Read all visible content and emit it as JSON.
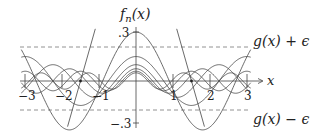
{
  "chart_data": {
    "type": "line",
    "title": "",
    "xlabel": "x",
    "ylabel": "f_n(x)",
    "xlim": [
      -3.1,
      3.3
    ],
    "ylim": [
      -0.35,
      0.35
    ],
    "x_ticks": [
      -3,
      -2,
      -1,
      1,
      2,
      3
    ],
    "x_tick_labels": [
      "−3",
      "−2",
      "−1",
      "1",
      "2",
      "3"
    ],
    "y_ticks": [
      0.3,
      -0.3
    ],
    "y_tick_labels": [
      ".3",
      "−.3"
    ],
    "grid": false,
    "epsilon": 0.2,
    "bands": [
      {
        "name": "g(x) + ε",
        "y": 0.2,
        "style": "dashed"
      },
      {
        "name": "g(x) − ε",
        "y": -0.2,
        "style": "dashed"
      }
    ],
    "annotations": [
      {
        "text": "g(x) + ε",
        "x": 3.1,
        "y": 0.22
      },
      {
        "text": "g(x) − ε",
        "x": 3.1,
        "y": -0.3
      }
    ],
    "points": [
      {
        "x": -1.5,
        "y": 0
      },
      {
        "x": 1.5,
        "y": 0
      }
    ],
    "series": [
      {
        "name": "f_1",
        "amplitude": 0.3,
        "frequency": 1.745
      },
      {
        "name": "f_2",
        "amplitude": 0.15,
        "frequency": 2.1
      },
      {
        "name": "f_3",
        "amplitude": 0.1,
        "frequency": 2.8
      },
      {
        "name": "f_4",
        "amplitude": 0.075,
        "frequency": 3.5
      },
      {
        "name": "f_5",
        "amplitude": 0.06,
        "frequency": 4.2
      },
      {
        "name": "f_6",
        "amplitude": 0.05,
        "frequency": 4.9
      }
    ],
    "steep_lines": [
      {
        "through": [
          -1.5,
          0
        ],
        "slope": 0.8
      },
      {
        "through": [
          1.5,
          0
        ],
        "slope": -0.8
      }
    ]
  },
  "labels": {
    "y_axis": "f",
    "y_axis_sub": "n",
    "y_axis_arg": "(x)",
    "x_axis": "x",
    "upper_band": "g(x) + ϵ",
    "lower_band": "g(x) − ϵ",
    "y_top": ".3",
    "y_bottom": "−.3",
    "xm3": "−3",
    "xm2": "−2",
    "xm1": "−1",
    "x1": "1",
    "x2": "2",
    "x3": "3"
  }
}
